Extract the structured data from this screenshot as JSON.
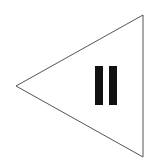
{
  "figure": {
    "shape": "triangle-left",
    "symbol": "pause-icon",
    "colors": {
      "background": "#ffffff",
      "outline": "#555555",
      "bars": "#111111"
    }
  }
}
